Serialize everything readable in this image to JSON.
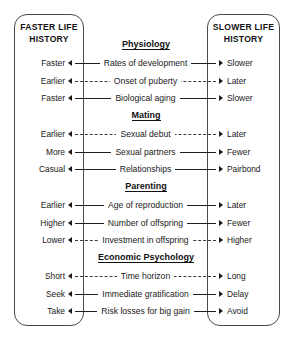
{
  "poles": {
    "left": {
      "title": "FASTER LIFE\nHISTORY",
      "title_line1": "FASTER LIFE",
      "title_line2": "HISTORY"
    },
    "right": {
      "title": "SLOWER LIFE\nHISTORY",
      "title_line1": "SLOWER LIFE",
      "title_line2": "HISTORY"
    }
  },
  "colors": {
    "ink": "#1a1a1a",
    "box_border": "#4a4a4a",
    "line": "#1f1f1f",
    "background": "#ffffff"
  },
  "sections": [
    {
      "header": "Physiology",
      "rows": [
        {
          "left": "Faster",
          "trait": "Rates of development",
          "right": "Slower",
          "line": "solid"
        },
        {
          "left": "Earlier",
          "trait": "Onset of puberty",
          "right": "Later",
          "line": "dashed"
        },
        {
          "left": "Faster",
          "trait": "Biological aging",
          "right": "Slower",
          "line": "solid"
        }
      ]
    },
    {
      "header": "Mating",
      "rows": [
        {
          "left": "Earlier",
          "trait": "Sexual debut",
          "right": "Later",
          "line": "dashed"
        },
        {
          "left": "More",
          "trait": "Sexual partners",
          "right": "Fewer",
          "line": "solid"
        },
        {
          "left": "Casual",
          "trait": "Relationships",
          "right": "Pairbond",
          "line": "solid"
        }
      ]
    },
    {
      "header": "Parenting",
      "rows": [
        {
          "left": "Earlier",
          "trait": "Age of reproduction",
          "right": "Later",
          "line": "solid"
        },
        {
          "left": "Higher",
          "trait": "Number of offspring",
          "right": "Fewer",
          "line": "solid"
        },
        {
          "left": "Lower",
          "trait": "Investment in offspring",
          "right": "Higher",
          "line": "dashed"
        }
      ]
    },
    {
      "header": "Economic Psychology",
      "rows": [
        {
          "left": "Short",
          "trait": "Time horizon",
          "right": "Long",
          "line": "dashed"
        },
        {
          "left": "Seek",
          "trait": "Immediate gratification",
          "right": "Delay",
          "line": "solid"
        },
        {
          "left": "Take",
          "trait": "Risk losses for big gain",
          "right": "Avoid",
          "line": "solid"
        }
      ]
    }
  ],
  "layout": {
    "section_header_y": [
      39,
      110,
      181,
      252
    ],
    "row_y": [
      55,
      73,
      90,
      126,
      144,
      161,
      197,
      215,
      232,
      268,
      286,
      303
    ]
  }
}
